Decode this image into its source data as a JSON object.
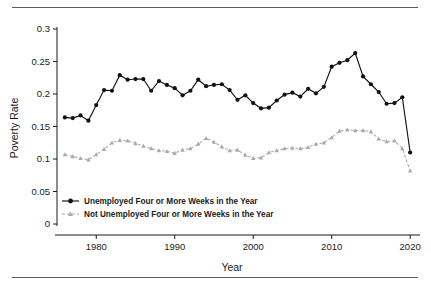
{
  "figure": {
    "y_axis_title": "Poverty Rate",
    "x_axis_title": "Year",
    "y_ticks": [
      "0",
      "0.05",
      "0.1",
      "0.15",
      "0.2",
      "0.25",
      "0.3"
    ],
    "x_ticks": [
      "1980",
      "1990",
      "2000",
      "2010",
      "2020"
    ],
    "legend": [
      {
        "label": "Unemployed Four or More Weeks in the Year",
        "marker": "filled-circle-marker",
        "color": "#111111",
        "style": "solid"
      },
      {
        "label": "Not Unemployed Four or More Weeks in the Year",
        "marker": "filled-triangle-marker",
        "color": "#a9a9a9",
        "style": "dashed"
      }
    ]
  },
  "chart_data": {
    "type": "line",
    "title": "",
    "xlabel": "Year",
    "ylabel": "Poverty Rate",
    "xlim": [
      1975,
      2021
    ],
    "ylim": [
      0,
      0.3
    ],
    "yticks": [
      0,
      0.05,
      0.1,
      0.15,
      0.2,
      0.25,
      0.3
    ],
    "xticks": [
      1980,
      1990,
      2000,
      2010,
      2020
    ],
    "grid": false,
    "legend_position": "lower-left-inside",
    "x": [
      1976,
      1977,
      1978,
      1979,
      1980,
      1981,
      1982,
      1983,
      1984,
      1985,
      1986,
      1987,
      1988,
      1989,
      1990,
      1991,
      1992,
      1993,
      1994,
      1995,
      1996,
      1997,
      1998,
      1999,
      2000,
      2001,
      2002,
      2003,
      2004,
      2005,
      2006,
      2007,
      2008,
      2009,
      2010,
      2011,
      2012,
      2013,
      2014,
      2015,
      2016,
      2017,
      2018,
      2019,
      2020
    ],
    "series": [
      {
        "name": "Unemployed Four or More Weeks in the Year",
        "color": "#111111",
        "marker": "circle",
        "style": "solid",
        "values": [
          0.164,
          0.163,
          0.167,
          0.159,
          0.183,
          0.206,
          0.205,
          0.229,
          0.222,
          0.223,
          0.223,
          0.205,
          0.22,
          0.214,
          0.209,
          0.198,
          0.205,
          0.222,
          0.212,
          0.214,
          0.215,
          0.206,
          0.191,
          0.198,
          0.186,
          0.178,
          0.179,
          0.19,
          0.199,
          0.202,
          0.196,
          0.208,
          0.201,
          0.211,
          0.242,
          0.248,
          0.252,
          0.263,
          0.227,
          0.215,
          0.203,
          0.185,
          0.186,
          0.195,
          0.11
        ]
      },
      {
        "name": "Not Unemployed Four or More Weeks in the Year",
        "color": "#a9a9a9",
        "marker": "triangle",
        "style": "dashed",
        "values": [
          0.107,
          0.104,
          0.101,
          0.099,
          0.107,
          0.115,
          0.125,
          0.129,
          0.128,
          0.124,
          0.12,
          0.116,
          0.113,
          0.112,
          0.109,
          0.114,
          0.116,
          0.123,
          0.132,
          0.126,
          0.119,
          0.113,
          0.114,
          0.106,
          0.101,
          0.102,
          0.11,
          0.113,
          0.116,
          0.117,
          0.116,
          0.118,
          0.123,
          0.125,
          0.133,
          0.143,
          0.145,
          0.144,
          0.144,
          0.142,
          0.131,
          0.127,
          0.128,
          0.116,
          0.082
        ]
      }
    ]
  }
}
